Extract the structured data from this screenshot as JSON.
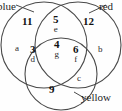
{
  "diagram": {
    "stroke_color": "#4a4a4a",
    "background_color": "#fefefe",
    "sets": [
      {
        "key": "blue",
        "label": "blue",
        "position": "top-left"
      },
      {
        "key": "red",
        "label": "red",
        "position": "top-right"
      },
      {
        "key": "yellow",
        "label": "yellow",
        "position": "bottom-right"
      }
    ],
    "regions": [
      {
        "key": "blue-only",
        "count": "11",
        "letter": ""
      },
      {
        "key": "red-only",
        "count": "12",
        "letter": ""
      },
      {
        "key": "yellow-only",
        "count": "9",
        "letter": ""
      },
      {
        "key": "blue-red",
        "count": "5",
        "letter": "e"
      },
      {
        "key": "blue-yellow",
        "count": "3",
        "letter": "d"
      },
      {
        "key": "red-yellow",
        "count": "6",
        "letter": "f"
      },
      {
        "key": "blue-red-yellow",
        "count": "4",
        "letter": "g"
      }
    ],
    "edge_letters": [
      {
        "key": "left",
        "letter": "a"
      },
      {
        "key": "right",
        "letter": "b"
      },
      {
        "key": "bottom-right",
        "letter": "c"
      }
    ]
  }
}
